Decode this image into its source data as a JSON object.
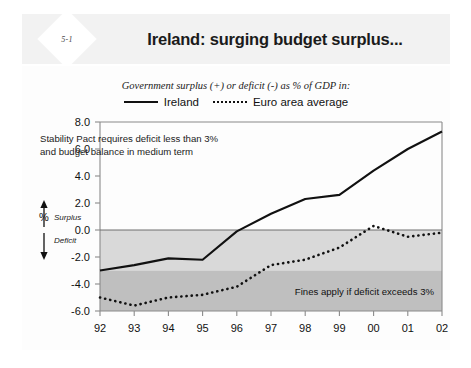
{
  "slide": {
    "badge": "5-1",
    "title": "Ireland: surging budget surplus..."
  },
  "chart_data": {
    "type": "line",
    "title": "Ireland: surging budget surplus...",
    "subtitle": "Government surplus (+) or deficit (-) as % of GDP in:",
    "xlabel": "",
    "ylabel": "%",
    "x": [
      "92",
      "93",
      "94",
      "95",
      "96",
      "97",
      "98",
      "99",
      "00",
      "01",
      "02"
    ],
    "categories": [
      "92",
      "93",
      "94",
      "95",
      "96",
      "97",
      "98",
      "99",
      "00",
      "01",
      "02"
    ],
    "series": [
      {
        "name": "Ireland",
        "style": "solid",
        "color": "#111111",
        "values": [
          -3.0,
          -2.6,
          -2.1,
          -2.2,
          -0.1,
          1.2,
          2.3,
          2.6,
          4.4,
          6.0,
          7.3
        ]
      },
      {
        "name": "Euro area average",
        "style": "dotted",
        "color": "#111111",
        "values": [
          -5.0,
          -5.6,
          -5.0,
          -4.8,
          -4.2,
          -2.6,
          -2.2,
          -1.3,
          0.3,
          -0.5,
          -0.2
        ]
      }
    ],
    "ylim": [
      -6.0,
      8.0
    ],
    "yticks": [
      "8.0",
      "6.0",
      "4.0",
      "2.0",
      "0.0",
      "-2.0",
      "-4.0",
      "-6.0"
    ],
    "ytick_values": [
      8.0,
      6.0,
      4.0,
      2.0,
      0.0,
      -2.0,
      -4.0,
      -6.0
    ],
    "grid": false,
    "legend_position": "top",
    "zero_line": 0.0,
    "bands": [
      {
        "name": "deficit-band",
        "from": 0.0,
        "to": -3.0,
        "color": "#d9d9d9"
      },
      {
        "name": "fines-band",
        "from": -3.0,
        "to": -6.0,
        "color": "#bfbfbf"
      }
    ],
    "annotations": [
      {
        "name": "stability-pact-note",
        "line1": "Stability Pact requires deficit less than 3%",
        "line2": "and budget balance in medium term"
      },
      {
        "name": "surplus-arrow-label",
        "text": "Surplus"
      },
      {
        "name": "deficit-arrow-label",
        "text": "Deficit"
      },
      {
        "name": "fines-band-label",
        "text": "Fines apply if deficit exceeds 3%"
      }
    ]
  }
}
